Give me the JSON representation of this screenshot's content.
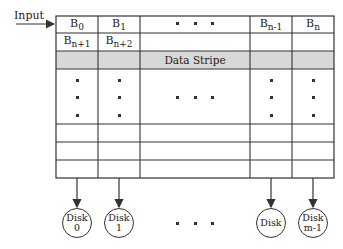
{
  "input_label": "Input",
  "header_row": {
    "b0": "B",
    "b0_sub": "0",
    "b1": "B",
    "b1_sub": "1",
    "bn1": "B",
    "bn1_sub": "n-1",
    "bn": "B",
    "bn_sub": "n"
  },
  "second_row": {
    "a": "B",
    "a_sub": "n+1",
    "b": "B",
    "b_sub": "n+2"
  },
  "stripe_label": "Data Stripe",
  "disks": [
    {
      "line1": "Disk",
      "line2": "0"
    },
    {
      "line1": "Disk",
      "line2": "1"
    },
    {
      "line1": "Disk",
      "line2": ""
    },
    {
      "line1": "Disk",
      "line2": "m-1"
    }
  ],
  "colors": {
    "stripe": "#d8d8d8",
    "line": "#333333"
  }
}
